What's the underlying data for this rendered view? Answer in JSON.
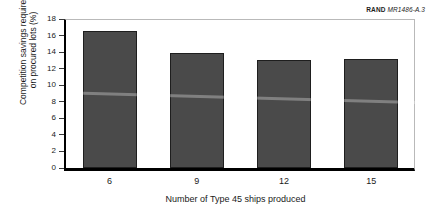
{
  "source": {
    "rand_mark": "RAND",
    "doc_code": "MR1486-A.3"
  },
  "chart_data": {
    "type": "bar",
    "title": "",
    "categories": [
      "6",
      "9",
      "12",
      "15"
    ],
    "values": [
      16.6,
      13.9,
      13.05,
      13.15
    ],
    "xlabel": "Number of Type 45 ships produced",
    "ylabel_line1": "Competition savings required",
    "ylabel_line2": "on procured lots (%)",
    "ylim": [
      0,
      18
    ],
    "yticks": [
      "18",
      "16",
      "14",
      "12",
      "10",
      "8",
      "6",
      "4",
      "2",
      "0"
    ],
    "grid": false,
    "legend": "none",
    "bar_color": "#4a4a4a",
    "bar_edge_color": "#1e1e1e",
    "axis_color": "#000000"
  }
}
